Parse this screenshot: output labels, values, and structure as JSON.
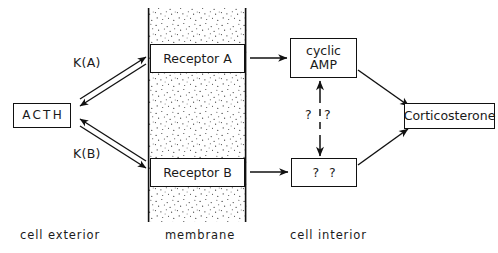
{
  "diagram": {
    "nodes": {
      "acth": "ACTH",
      "receptor_a": "Receptor A",
      "receptor_b": "Receptor B",
      "cyclic_amp_line1": "cyclic",
      "cyclic_amp_line2": "AMP",
      "unknown_mediator": "? ?",
      "corticosterone": "Corticosterone"
    },
    "edge_labels": {
      "k_a": "K(A)",
      "k_b": "K(B)",
      "question_left": "?",
      "question_right": "?"
    },
    "zone_captions": {
      "exterior": "cell exterior",
      "membrane": "membrane",
      "interior": "cell interior"
    },
    "colors": {
      "stroke": "#111111",
      "background": "#ffffff",
      "membrane_fill": "#ffffff",
      "stipple": "#3a3a3a"
    }
  }
}
